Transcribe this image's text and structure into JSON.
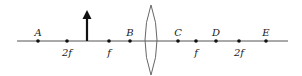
{
  "diagram": {
    "axis": {
      "x1": 17,
      "x2": 288,
      "y": 41,
      "color": "#555555"
    },
    "lens": {
      "cx": 151,
      "top": 5,
      "bottom": 75,
      "half_width": 6,
      "color": "#555555"
    },
    "object_arrow": {
      "x": 87,
      "base_y": 41,
      "tip_y": 12,
      "color": "#111111"
    },
    "points": [
      {
        "id": "A",
        "x": 38,
        "label": "A",
        "label_pos": "above"
      },
      {
        "id": "2f-left",
        "x": 67,
        "label": "2f",
        "label_pos": "below"
      },
      {
        "id": "f-left",
        "x": 109,
        "label": "f",
        "label_pos": "below"
      },
      {
        "id": "B",
        "x": 130,
        "label": "B",
        "label_pos": "above"
      },
      {
        "id": "C",
        "x": 178,
        "label": "C",
        "label_pos": "above"
      },
      {
        "id": "f-right",
        "x": 196,
        "label": "f",
        "label_pos": "below"
      },
      {
        "id": "D",
        "x": 216,
        "label": "D",
        "label_pos": "above"
      },
      {
        "id": "2f-right",
        "x": 239,
        "label": "2f",
        "label_pos": "below"
      },
      {
        "id": "E",
        "x": 266,
        "label": "E",
        "label_pos": "above"
      }
    ],
    "labels": {
      "A": "A",
      "B": "B",
      "C": "C",
      "D": "D",
      "E": "E",
      "two_f_left": "2f",
      "f_left": "f",
      "f_right": "f",
      "two_f_right": "2f"
    }
  }
}
